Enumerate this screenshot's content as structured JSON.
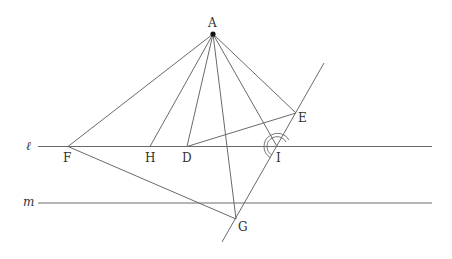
{
  "diagram": {
    "type": "geometry",
    "colors": {
      "line": "#6a6a6a",
      "text": "#333333",
      "point": "#111111"
    },
    "lines": {
      "l": {
        "label": "ℓ",
        "y": 146.5,
        "x1": 38,
        "x2": 432
      },
      "m": {
        "label": "m",
        "y": 203,
        "x1": 38,
        "x2": 432
      }
    },
    "points": {
      "A": {
        "label": "A",
        "x": 213,
        "y": 34
      },
      "F": {
        "label": "F",
        "x": 68,
        "y": 146.5
      },
      "H": {
        "label": "H",
        "x": 150,
        "y": 146.5
      },
      "D": {
        "label": "D",
        "x": 187,
        "y": 146.5
      },
      "I": {
        "label": "I",
        "x": 277,
        "y": 146.5
      },
      "E": {
        "label": "E",
        "x": 296,
        "y": 113
      },
      "G": {
        "label": "G",
        "x": 236,
        "y": 219
      }
    },
    "segments": [
      "AF",
      "AH",
      "AD",
      "AG",
      "AI",
      "AE",
      "DE",
      "FG"
    ],
    "transversal": {
      "through": [
        "G",
        "I",
        "E"
      ],
      "from": [
        222,
        242
      ],
      "to": [
        324,
        63
      ]
    },
    "angle_mark": {
      "at": "I",
      "style": "double-arc"
    }
  }
}
